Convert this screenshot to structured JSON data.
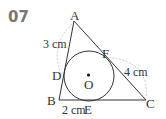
{
  "problem": {
    "number": "07"
  },
  "figure": {
    "points": {
      "A": "A",
      "B": "B",
      "C": "C",
      "D": "D",
      "E": "E",
      "F": "F",
      "O": "O"
    },
    "measurements": {
      "AD": "3 cm",
      "CF": "4 cm",
      "BE": "2 cm"
    }
  }
}
